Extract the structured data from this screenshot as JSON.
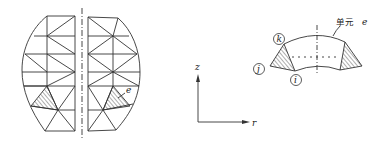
{
  "figure_left": {
    "description": "Axisymmetric body meshed with triangular ring elements",
    "element_label": "e"
  },
  "axes": {
    "vertical_label": "z",
    "horizontal_label": "r"
  },
  "figure_right": {
    "callout_label": "单元",
    "callout_symbol": "e",
    "nodes": [
      "k",
      "j",
      "i"
    ]
  },
  "colors": {
    "line": "#333333",
    "background": "#ffffff"
  }
}
